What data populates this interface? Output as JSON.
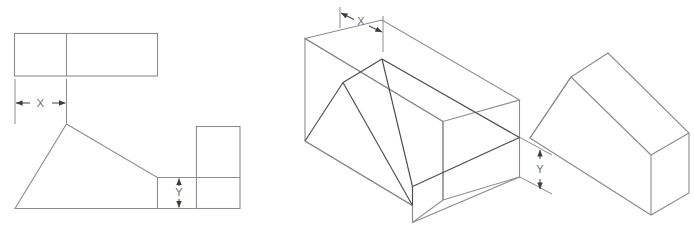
{
  "figure": {
    "stroke_color": "#8c8c8c",
    "stroke_color_dark": "#4d4d4d",
    "dimension_color": "#4a4a4a",
    "label_color": "#6e6e6e",
    "background_color": "#ffffff"
  },
  "views": [
    {
      "id": "orthographic-multiview",
      "name": "Orthographic multiview (top, front, right side)",
      "dimensions": [
        {
          "id": "x",
          "label": "X",
          "orientation": "horizontal"
        },
        {
          "id": "y",
          "label": "Y",
          "orientation": "vertical"
        }
      ]
    },
    {
      "id": "isometric-dimensioned",
      "name": "Isometric view with construction lines",
      "dimensions": [
        {
          "id": "x",
          "label": "X",
          "orientation": "oblique"
        },
        {
          "id": "y",
          "label": "Y",
          "orientation": "vertical"
        }
      ]
    },
    {
      "id": "isometric-solid",
      "name": "Isometric view of finished solid",
      "dimensions": []
    }
  ],
  "labels": {
    "view1_dim_x": "X",
    "view1_dim_y": "Y",
    "view2_dim_x": "X",
    "view2_dim_y": "Y"
  }
}
